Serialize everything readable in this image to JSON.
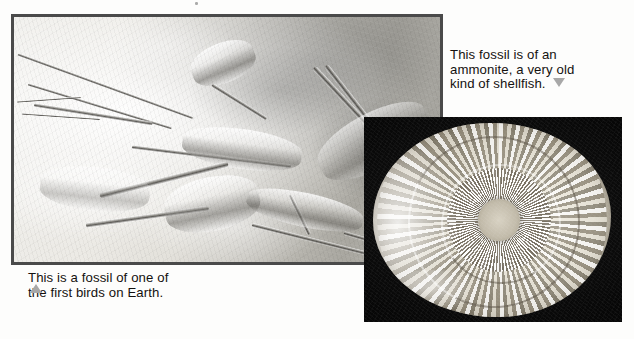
{
  "page": {
    "width": 634,
    "height": 339,
    "background_color": "#fdfdfc",
    "kind": "textbook-page-scan"
  },
  "figures": [
    {
      "id": "bird-fossil",
      "name": "archaeopteryx-fossil-photo",
      "subject": "Archaeopteryx fossil skeleton in limestone slab",
      "tone": "grayscale",
      "border_color": "#4a4a4a",
      "position": {
        "left": 11,
        "top": 14,
        "width": 432,
        "height": 251
      }
    },
    {
      "id": "ammonite-fossil",
      "name": "ammonite-fossil-photo",
      "subject": "Ammonite spiral shell fossil on black background",
      "tone": "grayscale",
      "background_color": "#0d0d0d",
      "position": {
        "left": 364,
        "top": 117,
        "width": 258,
        "height": 205
      }
    }
  ],
  "captions": {
    "bird": {
      "marker": "triangle-up",
      "marker_color": "#a8a8a8",
      "line1": "This is a fossil of one of",
      "line2": "the first birds on Earth.",
      "full_text": "This is a fossil of one of the first birds on Earth."
    },
    "ammonite": {
      "marker": "triangle-down",
      "marker_color": "#a8a8a8",
      "line1": "This fossil is of an",
      "line2": "ammonite, a very old",
      "line3": "kind of shellfish.",
      "full_text": "This fossil is of an ammonite, a very old kind of shellfish."
    }
  }
}
